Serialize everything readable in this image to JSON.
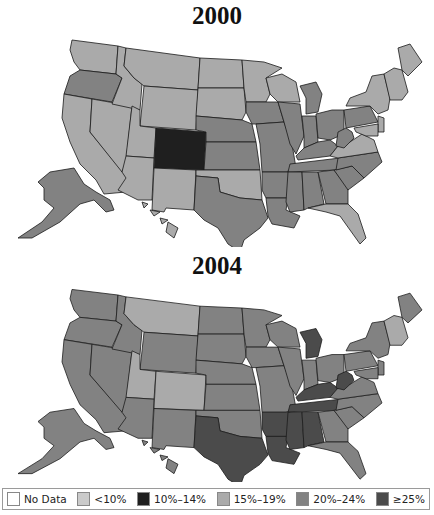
{
  "maps": [
    {
      "year": "2000"
    },
    {
      "year": "2004"
    }
  ],
  "legend": {
    "items": [
      {
        "label": "No Data",
        "color": "#ffffff"
      },
      {
        "label": "<10%",
        "color": "#cacaca"
      },
      {
        "label": "10%–14%",
        "color": "#1f1f1f"
      },
      {
        "label": "15%–19%",
        "color": "#aaaaaa"
      },
      {
        "label": "20%–24%",
        "color": "#828282"
      },
      {
        "label": "≥25%",
        "color": "#4b4b4b"
      }
    ]
  },
  "categories": {
    "nodata": "#ffffff",
    "lt10": "#cacaca",
    "c10_14": "#1f1f1f",
    "c15_19": "#aaaaaa",
    "c20_24": "#828282",
    "ge25": "#4b4b4b"
  },
  "state_values_2000": {
    "WA": "c15_19",
    "OR": "c20_24",
    "CA": "c15_19",
    "NV": "c15_19",
    "ID": "c15_19",
    "MT": "c15_19",
    "WY": "c15_19",
    "UT": "c15_19",
    "AZ": "c15_19",
    "CO": "c10_14",
    "NM": "c15_19",
    "ND": "c15_19",
    "SD": "c15_19",
    "NE": "c20_24",
    "KS": "c20_24",
    "OK": "c15_19",
    "TX": "c20_24",
    "MN": "c15_19",
    "IA": "c20_24",
    "MO": "c20_24",
    "AR": "c20_24",
    "LA": "c20_24",
    "WI": "c15_19",
    "IL": "c20_24",
    "MI": "c20_24",
    "IN": "c20_24",
    "OH": "c20_24",
    "KY": "c20_24",
    "TN": "c20_24",
    "MS": "c20_24",
    "AL": "c20_24",
    "GA": "c20_24",
    "FL": "c15_19",
    "SC": "c20_24",
    "NC": "c20_24",
    "VA": "c15_19",
    "WV": "c20_24",
    "PA": "c20_24",
    "NY": "c15_19",
    "NE_ENG": "c15_19",
    "ME": "c15_19",
    "NJ": "c15_19",
    "MD": "c15_19",
    "AK": "c20_24",
    "HI": "c15_19"
  },
  "state_values_2004": {
    "WA": "c20_24",
    "OR": "c20_24",
    "CA": "c20_24",
    "NV": "c20_24",
    "ID": "c20_24",
    "MT": "c15_19",
    "WY": "c20_24",
    "UT": "c15_19",
    "AZ": "c20_24",
    "CO": "c15_19",
    "NM": "c20_24",
    "ND": "c20_24",
    "SD": "c20_24",
    "NE": "c20_24",
    "KS": "c20_24",
    "OK": "c20_24",
    "TX": "ge25",
    "MN": "c20_24",
    "IA": "c20_24",
    "MO": "c20_24",
    "AR": "ge25",
    "LA": "ge25",
    "WI": "c20_24",
    "IL": "c20_24",
    "MI": "ge25",
    "IN": "c20_24",
    "OH": "c20_24",
    "KY": "ge25",
    "TN": "ge25",
    "MS": "ge25",
    "AL": "ge25",
    "GA": "c20_24",
    "FL": "c20_24",
    "SC": "c20_24",
    "NC": "c20_24",
    "VA": "c20_24",
    "WV": "ge25",
    "PA": "c20_24",
    "NY": "c20_24",
    "NE_ENG": "c15_19",
    "ME": "c20_24",
    "NJ": "c20_24",
    "MD": "c20_24",
    "AK": "c20_24",
    "HI": "c20_24"
  }
}
